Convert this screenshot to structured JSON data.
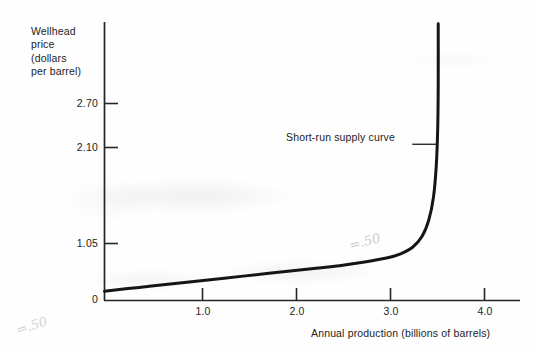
{
  "figure": {
    "kind": "scanned-textbook-figure",
    "annotation_label": "Short-run supply curve",
    "pencil_marks": {
      "near_curve": "=.50",
      "lower_left_margin": "=.50"
    }
  },
  "chart_data": {
    "type": "line",
    "title": "",
    "subtitle": "",
    "xlabel": "Annual production (billions of barrels)",
    "ylabel": "Wellhead price (dollars per barrel)",
    "ylabel_lines": [
      "Wellhead",
      "price",
      "(dollars",
      "per barrel)"
    ],
    "xlim": [
      0,
      4.42
    ],
    "ylim": [
      0,
      3.28
    ],
    "xticks": [
      0,
      1.0,
      2.0,
      3.0,
      4.0
    ],
    "xtick_labels": [
      "0",
      "1.0",
      "2.0",
      "3.0",
      "4.0"
    ],
    "yticks": [
      0,
      1.05,
      2.1,
      2.7
    ],
    "ytick_labels": [
      "0",
      "1.05",
      "2.10",
      "2.70"
    ],
    "grid": false,
    "legend_position": "none",
    "series": [
      {
        "name": "Short-run supply curve",
        "color": "#151515",
        "line_width": 3.0,
        "description": "Nearly flat at low output, then turns sharply vertical at a capacity limit of about 3.54 billion barrels.",
        "points": [
          {
            "x": 0.0,
            "y": 0.11
          },
          {
            "x": 0.25,
            "y": 0.14
          },
          {
            "x": 0.5,
            "y": 0.17
          },
          {
            "x": 0.75,
            "y": 0.2
          },
          {
            "x": 1.0,
            "y": 0.23
          },
          {
            "x": 1.25,
            "y": 0.26
          },
          {
            "x": 1.5,
            "y": 0.29
          },
          {
            "x": 1.75,
            "y": 0.32
          },
          {
            "x": 2.0,
            "y": 0.35
          },
          {
            "x": 2.25,
            "y": 0.38
          },
          {
            "x": 2.5,
            "y": 0.41
          },
          {
            "x": 2.75,
            "y": 0.45
          },
          {
            "x": 3.0,
            "y": 0.5
          },
          {
            "x": 3.15,
            "y": 0.55
          },
          {
            "x": 3.28,
            "y": 0.63
          },
          {
            "x": 3.38,
            "y": 0.76
          },
          {
            "x": 3.45,
            "y": 0.95
          },
          {
            "x": 3.5,
            "y": 1.22
          },
          {
            "x": 3.53,
            "y": 1.6
          },
          {
            "x": 3.545,
            "y": 2.05
          },
          {
            "x": 3.55,
            "y": 2.55
          },
          {
            "x": 3.55,
            "y": 3.26
          }
        ],
        "asymptote_x": 3.54
      }
    ],
    "annotations": [
      {
        "text": "Short-run supply curve",
        "x": 3.54,
        "y": 1.84,
        "leader": true
      }
    ]
  }
}
